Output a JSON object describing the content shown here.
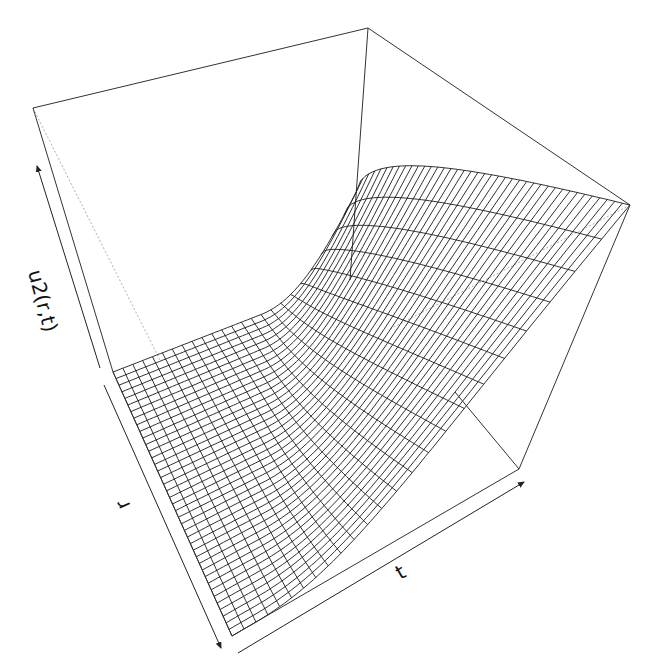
{
  "chart_data": {
    "type": "surface3d",
    "renderer": "persp",
    "title": "",
    "xlabel": "r",
    "ylabel": "t",
    "zlabel": "u2(r,t)",
    "grid": {
      "r_lines": 40,
      "t_lines": 24
    },
    "surface_description": "u2(r,t) is approximately 0 over most of the (r,t) domain and rises steeply (exponential-like) to its maximum near the edge at maximum r and maximum t",
    "z_range": [
      0,
      1
    ],
    "ticks": "none (axes drawn as arrows without tick labels)",
    "box": true,
    "colors": {
      "mesh": "#1a1a1a",
      "box": "#333333",
      "hidden_box": "#9a9a9a",
      "background": "#ffffff"
    }
  },
  "labels": {
    "z_axis": "u2(r,t)",
    "r_axis": "r",
    "t_axis": "t"
  },
  "projection": {
    "bottom": {
      "A": [
        113,
        372
      ],
      "B": [
        232,
        636
      ],
      "C": [
        519,
        469
      ],
      "D": [
        350,
        280
      ]
    },
    "top": {
      "A": [
        33,
        108
      ],
      "B": [
        190,
        420
      ],
      "C": [
        630,
        205
      ],
      "D": [
        368,
        28
      ]
    }
  }
}
